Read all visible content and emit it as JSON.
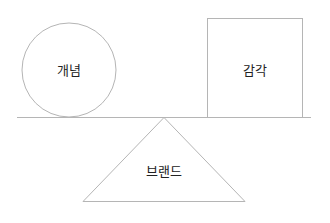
{
  "diagram": {
    "nodes": [
      {
        "id": "concept",
        "shape": "circle",
        "label": "개념"
      },
      {
        "id": "sense",
        "shape": "square",
        "label": "감각"
      },
      {
        "id": "brand",
        "shape": "triangle",
        "label": "브랜드"
      }
    ],
    "colors": {
      "stroke": "#b5b5b5",
      "text": "#222222",
      "background": "#ffffff"
    }
  }
}
